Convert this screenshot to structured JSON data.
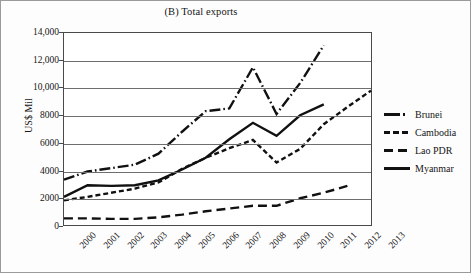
{
  "chart_data": {
    "type": "line",
    "title": "(B) Total exports",
    "xlabel": "",
    "ylabel": "US$ Mil",
    "categories": [
      "2000",
      "2001",
      "2002",
      "2003",
      "2004",
      "2005",
      "2006",
      "2007",
      "2008",
      "2009",
      "2010",
      "2011",
      "2012",
      "2013"
    ],
    "ylim": [
      0,
      14000
    ],
    "yticks": [
      "0",
      "2000",
      "4000",
      "6000",
      "8000",
      "10,000",
      "12,000",
      "14,000"
    ],
    "ytick_values": [
      0,
      2000,
      4000,
      6000,
      8000,
      10000,
      12000,
      14000
    ],
    "grid": "horizontal",
    "legend_position": "right",
    "series": [
      {
        "name": "Brunei",
        "style": "dash-dot",
        "color": "#111111",
        "values": [
          3300,
          3900,
          4150,
          4400,
          5200,
          6800,
          8300,
          8500,
          11500,
          8100,
          10350,
          13100,
          null,
          null
        ]
      },
      {
        "name": "Cambodia",
        "style": "dashed-short",
        "color": "#111111",
        "values": [
          1800,
          2050,
          2350,
          2650,
          3100,
          4100,
          4900,
          5600,
          6200,
          4550,
          5550,
          7350,
          8600,
          9800
        ]
      },
      {
        "name": "Lao PDR",
        "style": "dashed-long",
        "color": "#111111",
        "values": [
          480,
          480,
          450,
          450,
          560,
          760,
          1000,
          1200,
          1400,
          1400,
          1950,
          2350,
          2850,
          null
        ]
      },
      {
        "name": "Myanmar",
        "style": "solid",
        "color": "#111111",
        "values": [
          2050,
          2900,
          2850,
          2900,
          3250,
          4050,
          4900,
          6250,
          7450,
          6500,
          8000,
          8800,
          null,
          null
        ]
      }
    ]
  },
  "legend": {
    "items": [
      {
        "label": "Brunei",
        "style": "dash-dot"
      },
      {
        "label": "Cambodia",
        "style": "dashed-short"
      },
      {
        "label": "Lao PDR",
        "style": "dashed-long"
      },
      {
        "label": "Myanmar",
        "style": "solid"
      }
    ]
  }
}
